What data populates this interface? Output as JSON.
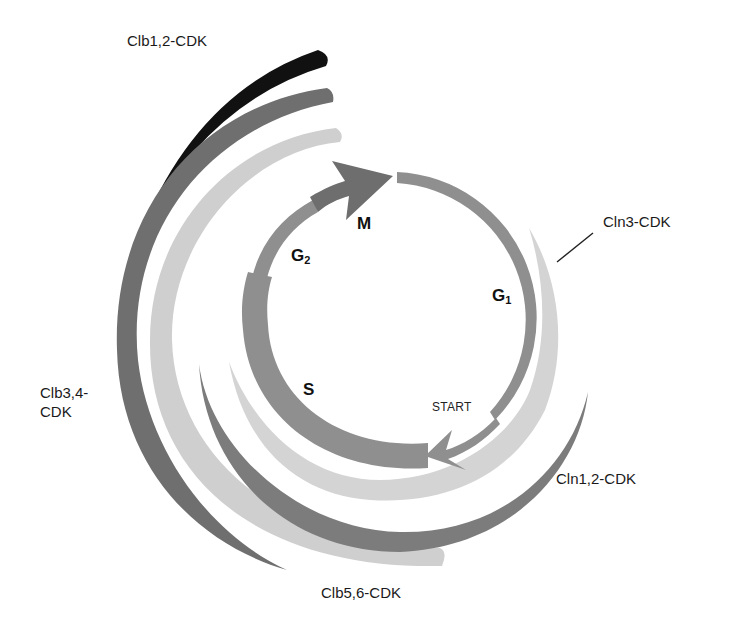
{
  "diagram": {
    "type": "cell-cycle-cyclin-cdk",
    "center": [
      393,
      318
    ],
    "colors": {
      "cycle_ring": "#8f8f8f",
      "m_arrow": "#6e6e6e",
      "clb12": "#111111",
      "clb34": "#6f6f6f",
      "clb56": "#cfcfcf",
      "cln12": "#7c7c7c",
      "cln3": "#d4d4d4",
      "leader_line": "#222222"
    },
    "phases": {
      "m": "M",
      "g2": "G",
      "g2_sub": "2",
      "g1": "G",
      "g1_sub": "1",
      "s": "S",
      "start": "START"
    },
    "complexes": {
      "clb12": "Clb1,2-CDK",
      "cln3": "Cln3-CDK",
      "clb34_line1": "Clb3,4-",
      "clb34_line2": "CDK",
      "cln12": "Cln1,2-CDK",
      "clb56": "Clb5,6-CDK"
    }
  }
}
